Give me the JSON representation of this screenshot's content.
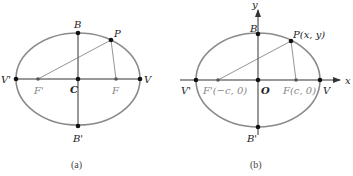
{
  "panel_a": {
    "caption": "(a)",
    "labels": {
      "B": "B",
      "B_prime": "B'",
      "P": "P",
      "V": "V",
      "V_prime": "V'",
      "C": "C",
      "F": "F",
      "F_prime": "F'"
    }
  },
  "panel_b": {
    "caption": "(b)",
    "labels": {
      "B": "B",
      "B_prime": "B'",
      "P": "P(x, y)",
      "V": "V",
      "V_prime": "V'",
      "O": "O",
      "F": "F(c, 0)",
      "F_prime": "F'(−c, 0)",
      "x_axis": "x",
      "y_axis": "y"
    }
  },
  "colors": {
    "ellipse": "#8a8a8a",
    "axis": "#333333",
    "point": "#111111",
    "focus_label": "#888888"
  }
}
